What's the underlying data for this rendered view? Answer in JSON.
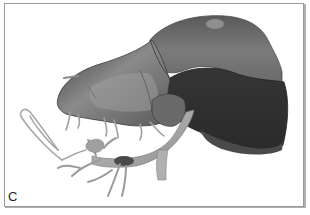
{
  "figure": {
    "panel_label": "C"
  },
  "colors": {
    "background": "#ffffff",
    "frame_border": "#9a9a9a",
    "light_lobe": "#8c8c8c",
    "mid_lobe": "#6e6e6e",
    "dark_lobe": "#3a3a3a",
    "vessels": "#a8a8a8"
  }
}
